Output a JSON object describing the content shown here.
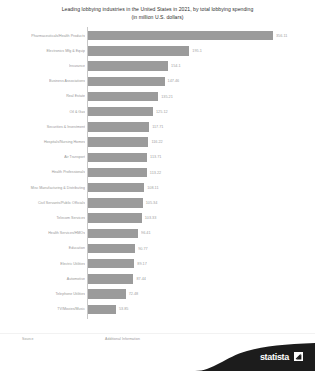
{
  "title": {
    "line1": "Leading lobbying industries in the United States in 2021, by total lobbying spending",
    "line2": "(in million U.S. dollars)"
  },
  "footer": {
    "source_label": "Source",
    "additional_label": "Additional Information",
    "logo_text": "statista",
    "logo_mark": "statista-arrow-mark"
  },
  "chart_data": {
    "type": "bar",
    "orientation": "horizontal",
    "title": "Leading lobbying industries in the United States in 2021, by total lobbying spending",
    "subtitle": "(in million U.S. dollars)",
    "xlabel": "",
    "ylabel": "",
    "unit": "million U.S. dollars",
    "grid": false,
    "legend": null,
    "xlim": [
      0,
      400
    ],
    "categories": [
      "Pharmaceuticals/Health Products",
      "Electronics Mfg & Equip",
      "Insurance",
      "Business Associations",
      "Real Estate",
      "Oil & Gas",
      "Securities & Investment",
      "Hospitals/Nursing Homes",
      "Air Transport",
      "Health Professionals",
      "Misc Manufacturing & Distributing",
      "Civil Servants/Public Officials",
      "Telecom Services",
      "Health Services/HMOs",
      "Education",
      "Electric Utilities",
      "Automotive",
      "Telephone Utilities",
      "TV/Movies/Music"
    ],
    "values": [
      356.11,
      195.1,
      154.1,
      147.46,
      135.21,
      125.12,
      117.71,
      116.22,
      113.71,
      113.22,
      108.11,
      105.34,
      103.33,
      96.41,
      90.77,
      89.17,
      87.44,
      72.48,
      53.85
    ],
    "value_labels": [
      "356.11",
      "195.1",
      "154.1",
      "147.46",
      "135.21",
      "125.12",
      "117.71",
      "116.22",
      "113.71",
      "113.22",
      "108.11",
      "105.34",
      "103.33",
      "96.41",
      "90.77",
      "89.17",
      "87.44",
      "72.48",
      "53.85"
    ],
    "bar_color": "#9b9b9b",
    "axis_color": "#c8c8c8"
  }
}
